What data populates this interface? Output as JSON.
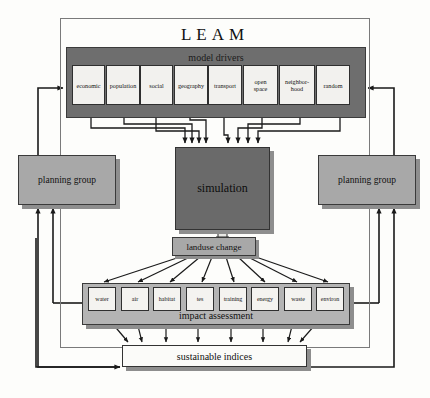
{
  "diagram": {
    "title": "LEAM",
    "bands": {
      "model_drivers_label": "model drivers",
      "impact_assessment_label": "impact assessment"
    },
    "model_drivers": [
      {
        "id": "economic",
        "label": "economic"
      },
      {
        "id": "population",
        "label": "population"
      },
      {
        "id": "social",
        "label": "social"
      },
      {
        "id": "geography",
        "label": "geography"
      },
      {
        "id": "transport",
        "label": "transport"
      },
      {
        "id": "open-space",
        "label": "open\nspace"
      },
      {
        "id": "neighborhood",
        "label": "neighbor-\nhood"
      },
      {
        "id": "random",
        "label": "random"
      }
    ],
    "simulation": {
      "label": "simulation"
    },
    "planning_group_left": {
      "label": "planning group"
    },
    "planning_group_right": {
      "label": "planning group"
    },
    "landuse_change": {
      "label": "landuse change"
    },
    "impact_factors": [
      {
        "id": "water",
        "label": "water"
      },
      {
        "id": "air",
        "label": "air"
      },
      {
        "id": "habitat",
        "label": "habitat"
      },
      {
        "id": "tes",
        "label": "tes"
      },
      {
        "id": "training",
        "label": "training"
      },
      {
        "id": "energy",
        "label": "energy"
      },
      {
        "id": "waste",
        "label": "waste"
      },
      {
        "id": "environ",
        "label": "environ"
      }
    ],
    "sustainable_indices": {
      "label": "sustainable indices"
    },
    "colors": {
      "dark_band": "#6e6e6e",
      "simulation_fill": "#6a6a6a",
      "planning_group_fill": "#a8a8a8",
      "impact_band_fill": "#b4b4b4",
      "box_fill": "#f2f1ee",
      "stroke": "#2f2f2f",
      "shadow": "#8e8e8e",
      "background": "#fdfdfb"
    }
  }
}
